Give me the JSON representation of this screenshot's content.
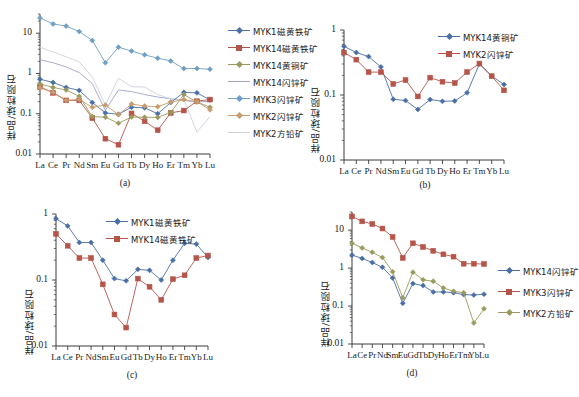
{
  "figure": {
    "ylabel": "样品/球粒陨石",
    "elements": [
      "La",
      "Ce",
      "Pr",
      "Nd",
      "Sm",
      "Eu",
      "Gd",
      "Tb",
      "Dy",
      "Ho",
      "Er",
      "Tm",
      "Yb",
      "Lu"
    ],
    "ytick_labels": [
      "0.01",
      "0.1",
      "1",
      "10"
    ],
    "colors": {
      "blue": "#4a6fa5",
      "red": "#b5554a",
      "olive": "#9a9a5e",
      "lavender": "#9fa3c8",
      "lightblue": "#6e9ec4",
      "tan": "#c99a6b",
      "palegray": "#cfd1da"
    }
  },
  "chart_data": [
    {
      "type": "line",
      "panel": "(a)",
      "title": "",
      "xlabel": "",
      "ylabel": "样品/球粒陨石",
      "x": [
        "La",
        "Ce",
        "Pr",
        "Nd",
        "Sm",
        "Eu",
        "Gd",
        "Tb",
        "Dy",
        "Ho",
        "Er",
        "Tm",
        "Yb",
        "Lu"
      ],
      "ylim": [
        0.01,
        30
      ],
      "yscale": "log",
      "ytick_labels": [
        "0.01",
        "0.1",
        "1",
        "10"
      ],
      "grid": false,
      "legend_position": "right",
      "series": [
        {
          "name": "MYK1磁黄铁矿",
          "color": "#4a6fa5",
          "marker": "diamond",
          "values": [
            0.72,
            0.6,
            0.45,
            0.38,
            0.19,
            0.105,
            0.097,
            0.145,
            0.14,
            0.1,
            0.19,
            0.34,
            0.33,
            0.22
          ]
        },
        {
          "name": "MYK14磁黄铁矿",
          "color": "#b5554a",
          "marker": "square",
          "values": [
            0.47,
            0.33,
            0.215,
            0.215,
            0.078,
            0.024,
            0.017,
            0.102,
            0.065,
            0.039,
            0.105,
            0.12,
            0.205,
            0.225
          ]
        },
        {
          "name": "MYK14黄铜矿",
          "color": "#9a9a5e",
          "marker": "diamond",
          "values": [
            0.55,
            0.45,
            0.39,
            0.27,
            0.085,
            0.082,
            0.058,
            0.083,
            0.082,
            0.081,
            0.108,
            0.3,
            0.195,
            0.145
          ]
        },
        {
          "name": "MYK14闪锌矿",
          "color": "#9fa3c8",
          "marker": "none",
          "values": [
            2.2,
            1.85,
            1.45,
            1.05,
            0.56,
            0.122,
            0.39,
            0.355,
            0.3,
            0.26,
            0.235,
            0.215,
            0.195,
            0.205
          ]
        },
        {
          "name": "MYK3闪锌矿",
          "color": "#6e9ec4",
          "marker": "diamond",
          "values": [
            24.0,
            17.0,
            15.0,
            11.0,
            6.6,
            1.85,
            4.5,
            3.6,
            2.9,
            2.4,
            2.05,
            1.32,
            1.33,
            1.28
          ]
        },
        {
          "name": "MYK2闪锌矿",
          "color": "#c99a6b",
          "marker": "diamond",
          "values": [
            0.44,
            0.34,
            0.215,
            0.225,
            0.145,
            0.165,
            0.095,
            0.175,
            0.155,
            0.15,
            0.195,
            0.225,
            0.2,
            0.125
          ]
        },
        {
          "name": "MYK2方铅矿",
          "color": "#cfd1da",
          "marker": "none",
          "values": [
            4.5,
            3.4,
            2.6,
            1.95,
            0.82,
            0.165,
            0.76,
            0.47,
            0.46,
            0.3,
            0.235,
            0.225,
            0.035,
            0.085
          ]
        }
      ]
    },
    {
      "type": "line",
      "panel": "(b)",
      "title": "",
      "xlabel": "",
      "ylabel": "样品/球粒陨石",
      "x": [
        "La",
        "Ce",
        "Pr",
        "Nd",
        "Sm",
        "Eu",
        "Gd",
        "Tb",
        "Dy",
        "Ho",
        "Er",
        "Tm",
        "Yb",
        "Lu"
      ],
      "ylim": [
        0.01,
        1
      ],
      "yscale": "log",
      "ytick_labels": [
        "0.01",
        "0.1",
        "1"
      ],
      "grid": false,
      "legend_position": "top-right",
      "series": [
        {
          "name": "MYK14黄铜矿",
          "color": "#4a6fa5",
          "marker": "diamond",
          "values": [
            0.56,
            0.45,
            0.39,
            0.27,
            0.086,
            0.082,
            0.06,
            0.085,
            0.08,
            0.081,
            0.108,
            0.3,
            0.195,
            0.145
          ]
        },
        {
          "name": "MYK2闪锌矿",
          "color": "#b5554a",
          "marker": "square",
          "values": [
            0.45,
            0.35,
            0.225,
            0.225,
            0.148,
            0.17,
            0.095,
            0.185,
            0.16,
            0.153,
            0.225,
            0.305,
            0.195,
            0.118
          ]
        }
      ]
    },
    {
      "type": "line",
      "panel": "(c)",
      "title": "",
      "xlabel": "",
      "ylabel": "样品/球粒陨石",
      "x": [
        "La",
        "Ce",
        "Pr",
        "Nd",
        "Sm",
        "Eu",
        "Gd",
        "Tb",
        "Dy",
        "Ho",
        "Er",
        "Tm",
        "Yb",
        "Lu"
      ],
      "ylim": [
        0.01,
        1
      ],
      "yscale": "log",
      "ytick_labels": [
        "0.01",
        "0.1",
        "1"
      ],
      "grid": false,
      "legend_position": "top-right",
      "series": [
        {
          "name": "MYK1磁黄铁矿",
          "color": "#4a6fa5",
          "marker": "diamond",
          "values": [
            0.85,
            0.66,
            0.37,
            0.37,
            0.2,
            0.105,
            0.097,
            0.145,
            0.14,
            0.1,
            0.2,
            0.36,
            0.35,
            0.22
          ]
        },
        {
          "name": "MYK14磁黄铁矿",
          "color": "#b5554a",
          "marker": "square",
          "values": [
            0.5,
            0.33,
            0.215,
            0.215,
            0.086,
            0.03,
            0.019,
            0.105,
            0.079,
            0.05,
            0.103,
            0.118,
            0.215,
            0.235
          ]
        }
      ]
    },
    {
      "type": "line",
      "panel": "(d)",
      "title": "",
      "xlabel": "",
      "ylabel": "样品/球粒陨石",
      "x": [
        "La",
        "Ce",
        "Pr",
        "Nd",
        "Sm",
        "Eu",
        "Gd",
        "Tb",
        "Dy",
        "Ho",
        "Er",
        "Tm",
        "Yb",
        "Lu"
      ],
      "ylim": [
        0.01,
        30
      ],
      "yscale": "log",
      "ytick_labels": [
        "0.01",
        "0.1",
        "1",
        "10"
      ],
      "grid": false,
      "legend_position": "right",
      "series": [
        {
          "name": "MYK14闪锌矿",
          "color": "#4a6fa5",
          "marker": "diamond",
          "values": [
            2.2,
            1.8,
            1.4,
            1.05,
            0.55,
            0.118,
            0.39,
            0.345,
            0.235,
            0.235,
            0.225,
            0.2,
            0.195,
            0.205
          ]
        },
        {
          "name": "MYK3闪锌矿",
          "color": "#b5554a",
          "marker": "square",
          "values": [
            23.0,
            17.0,
            14.5,
            11.0,
            6.6,
            1.85,
            4.5,
            3.6,
            2.85,
            2.3,
            2.0,
            1.3,
            1.3,
            1.28
          ]
        },
        {
          "name": "MYK2方铅矿",
          "color": "#9a9a5e",
          "marker": "diamond",
          "values": [
            4.5,
            3.4,
            2.6,
            1.9,
            0.8,
            0.165,
            0.78,
            0.49,
            0.45,
            0.3,
            0.245,
            0.225,
            0.036,
            0.085
          ]
        }
      ]
    }
  ],
  "panels": {
    "a": {
      "label": "(a)"
    },
    "b": {
      "label": "(b)"
    },
    "c": {
      "label": "(c)"
    },
    "d": {
      "label": "(d)"
    }
  }
}
